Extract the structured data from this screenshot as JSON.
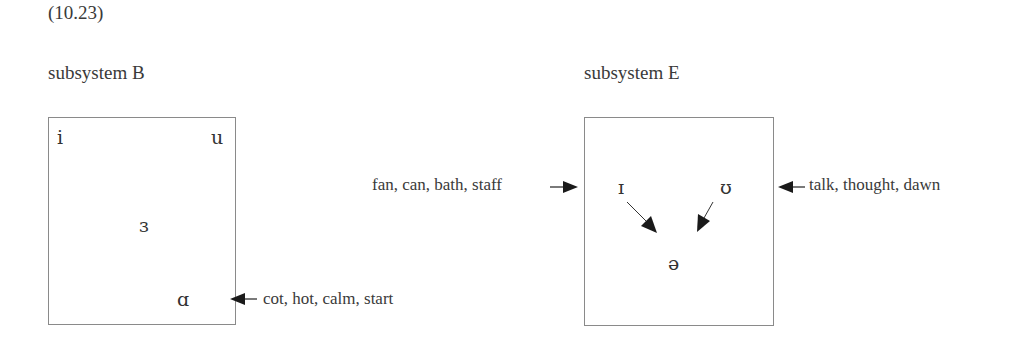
{
  "example_number": "(10.23)",
  "subsystem_b": {
    "title": "subsystem B",
    "vowels": {
      "high_front": "i",
      "high_back": "u",
      "mid": "ɜ",
      "low": "ɑ"
    },
    "annotation": {
      "label": "cot, hot, calm, start",
      "target": "ɑ",
      "direction": "into-box"
    }
  },
  "subsystem_e": {
    "title": "subsystem E",
    "vowels": {
      "front": "ɪ",
      "back": "ʊ",
      "mid": "ə"
    },
    "annotation_left": {
      "label": "fan, can, bath, staff",
      "target": "ɪ",
      "direction": "into-box"
    },
    "annotation_right": {
      "label": "talk, thought, dawn",
      "target": "ʊ",
      "direction": "into-box"
    },
    "internal_arrows": [
      {
        "from": "ɪ",
        "to": "ə"
      },
      {
        "from": "ʊ",
        "to": "ə"
      }
    ]
  }
}
